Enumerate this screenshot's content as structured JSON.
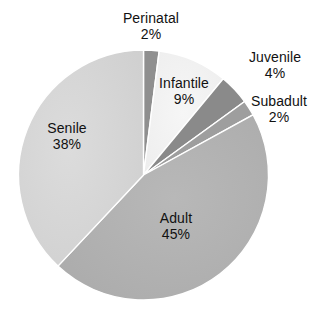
{
  "chart_data": {
    "type": "pie",
    "title": "",
    "subtitle": "",
    "xlabel": "",
    "ylabel": "",
    "legend": "none",
    "grid": false,
    "units": "percent",
    "categories": [
      "Perinatal",
      "Infantile",
      "Juvenile",
      "Subadult",
      "Adult",
      "Senile"
    ],
    "values": [
      2,
      9,
      4,
      2,
      45,
      38
    ],
    "slices": [
      {
        "label": "Perinatal",
        "value": 2,
        "value_text": "2%",
        "color": "#8f8f8f",
        "label_position": "outside",
        "start_angle_deg": 0,
        "end_angle_deg": 7.2
      },
      {
        "label": "Infantile",
        "value": 9,
        "value_text": "9%",
        "color": "#f2f2f2",
        "label_position": "inside",
        "start_angle_deg": 7.2,
        "end_angle_deg": 39.6
      },
      {
        "label": "Juvenile",
        "value": 4,
        "value_text": "4%",
        "color": "#8a8a8a",
        "label_position": "outside",
        "start_angle_deg": 39.6,
        "end_angle_deg": 54.0
      },
      {
        "label": "Subadult",
        "value": 2,
        "value_text": "2%",
        "color": "#9e9e9e",
        "label_position": "outside",
        "start_angle_deg": 54.0,
        "end_angle_deg": 61.2
      },
      {
        "label": "Adult",
        "value": 45,
        "value_text": "45%",
        "color": "#b3b3b3",
        "label_position": "inside",
        "start_angle_deg": 61.2,
        "end_angle_deg": 223.2
      },
      {
        "label": "Senile",
        "value": 38,
        "value_text": "38%",
        "color": "#d6d6d6",
        "label_position": "inside",
        "start_angle_deg": 223.2,
        "end_angle_deg": 360
      }
    ],
    "outline_color": "#ffffff",
    "background": "#ffffff"
  },
  "labels": {
    "perinatal": {
      "name": "Perinatal",
      "value": "2%"
    },
    "infantile": {
      "name": "Infantile",
      "value": "9%"
    },
    "juvenile": {
      "name": "Juvenile",
      "value": "4%"
    },
    "subadult": {
      "name": "Subadult",
      "value": "2%"
    },
    "adult": {
      "name": "Adult",
      "value": "45%"
    },
    "senile": {
      "name": "Senile",
      "value": "38%"
    }
  }
}
